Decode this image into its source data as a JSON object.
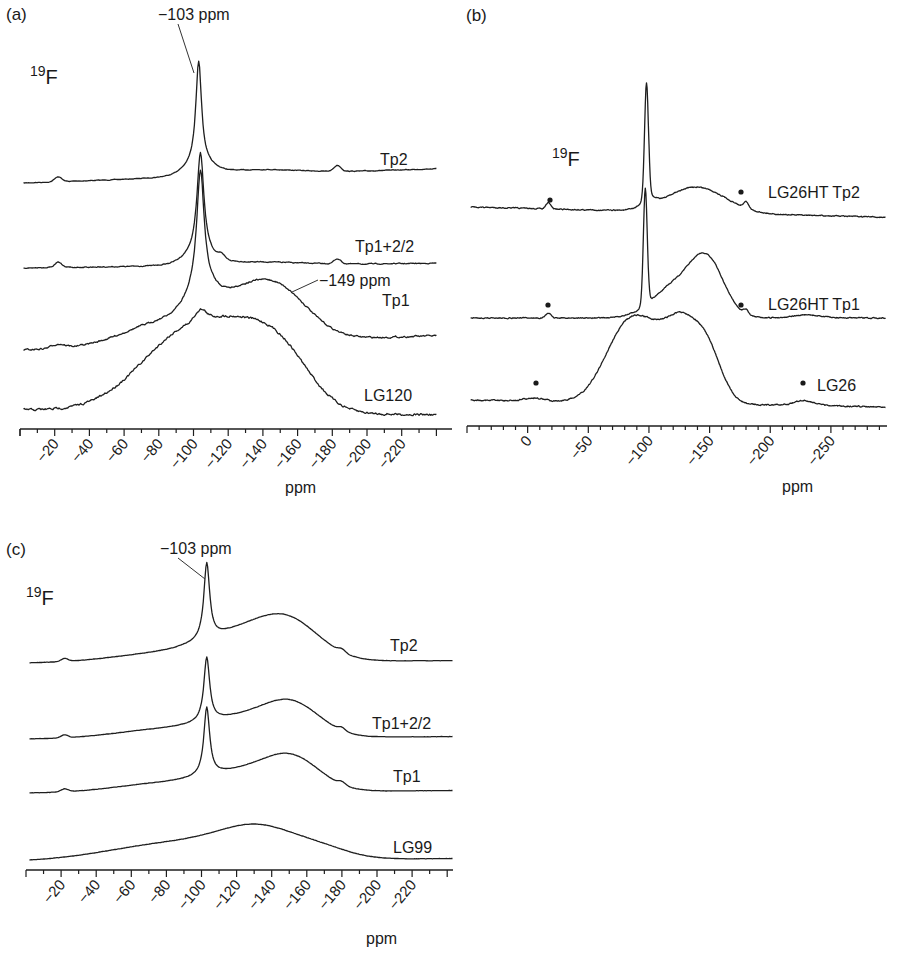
{
  "figure": {
    "panels": [
      {
        "id": "a",
        "label": "(a)",
        "nucleus": {
          "mass": "19",
          "symbol": "F"
        },
        "annotations": [
          {
            "text": "−103 ppm",
            "x": 158,
            "y": 20,
            "line": [
              178,
              24,
              194,
              73
            ]
          },
          {
            "text": "−149 ppm",
            "x": 319,
            "y": 286,
            "line": [
              318,
              280,
              292,
              292
            ]
          }
        ],
        "axis": {
          "label": "ppm",
          "label_x": 285,
          "label_y": 493
        }
      },
      {
        "id": "b",
        "label": "(b)",
        "nucleus": {
          "mass": "19",
          "symbol": "F"
        },
        "annotations": [],
        "axis": {
          "label": "ppm",
          "label_x": 782,
          "label_y": 492
        }
      },
      {
        "id": "c",
        "label": "(c)",
        "nucleus": {
          "mass": "19",
          "symbol": "F"
        },
        "annotations": [
          {
            "text": "−103 ppm",
            "x": 160,
            "y": 554,
            "line": [
              178,
              558,
              205,
              579
            ]
          }
        ],
        "axis": {
          "label": "ppm",
          "label_x": 366,
          "label_y": 944
        }
      }
    ]
  },
  "chart_data": [
    {
      "type": "line",
      "panel": "(a)",
      "title": "",
      "nucleus_label": "19F",
      "xlabel": "ppm",
      "ylabel": "",
      "x_reversed": true,
      "xlim": [
        0,
        -240
      ],
      "x_ticks": [
        -20,
        -40,
        -60,
        -80,
        -100,
        -120,
        -140,
        -160,
        -180,
        -200,
        -220
      ],
      "x_tick_labels": [
        "−20",
        "−40",
        "−60",
        "−80",
        "−100",
        "−120",
        "−140",
        "−160",
        "−180",
        "−200",
        "−220"
      ],
      "grid": false,
      "annotations": [
        "−103 ppm",
        "−149 ppm"
      ],
      "series": [
        {
          "name": "Tp2",
          "peak_ppm": -103,
          "features": "sharp peak at −103 ppm; weak broad hump −110 to −170 ppm; spinning sidebands near −22 and −183 ppm"
        },
        {
          "name": "Tp1+2/2",
          "peak_ppm": -104,
          "features": "sharp peak at −104 ppm; shoulder at −115 ppm; sidebands near −22 and −183 ppm"
        },
        {
          "name": "Tp1",
          "peak_ppm": -104,
          "features": "sharp peak at −104 ppm; broad component centered at −149 ppm"
        },
        {
          "name": "LG120",
          "peak_ppm": -104,
          "features": "broad envelope −50 to −180 ppm with maxima near −104 and −149 ppm"
        }
      ]
    },
    {
      "type": "line",
      "panel": "(b)",
      "title": "",
      "nucleus_label": "19F",
      "xlabel": "ppm",
      "ylabel": "",
      "x_reversed": true,
      "xlim": [
        50,
        -295
      ],
      "x_ticks": [
        0,
        -50,
        -100,
        -150,
        -200,
        -250
      ],
      "x_tick_labels": [
        "0",
        "−50",
        "−100",
        "−150",
        "−200",
        "−250"
      ],
      "grid": false,
      "sideband_marker": "•",
      "series": [
        {
          "name": "LG26HT Tp2",
          "peak_ppm": -98,
          "features": "sharp peak at −98 ppm; broad hump near −145 ppm; sidebands (•) near −17 and −180 ppm"
        },
        {
          "name": "LG26HT Tp1",
          "peak_ppm": -97,
          "features": "sharp peak at −97 ppm; broad peak at −148 ppm; sidebands (•) near −17 and −180 ppm; weak hump near −230 ppm"
        },
        {
          "name": "LG26",
          "peak_ppm": -148,
          "features": "broad plateau −75 to −135 ppm with maximum at −148 ppm; sidebands (•) near −5 and −228 ppm"
        }
      ]
    },
    {
      "type": "line",
      "panel": "(c)",
      "title": "",
      "nucleus_label": "19F",
      "xlabel": "ppm",
      "ylabel": "",
      "x_reversed": true,
      "xlim": [
        0,
        -240
      ],
      "x_ticks": [
        -20,
        -40,
        -60,
        -80,
        -100,
        -120,
        -140,
        -160,
        -180,
        -200,
        -220
      ],
      "x_tick_labels": [
        "−20",
        "−40",
        "−60",
        "−80",
        "−100",
        "−120",
        "−140",
        "−160",
        "−180",
        "−200",
        "−220"
      ],
      "grid": false,
      "annotations": [
        "−103 ppm"
      ],
      "series": [
        {
          "name": "Tp2",
          "peak_ppm": -103,
          "features": "sharp peak at −103 ppm; broad component peaking near −150 ppm"
        },
        {
          "name": "Tp1+2/2",
          "peak_ppm": -103,
          "features": "sharp peak at −103 ppm; broad component peaking near −152 ppm"
        },
        {
          "name": "Tp1",
          "peak_ppm": -103,
          "features": "sharp peak at −103 ppm; broad component peaking near −152 ppm"
        },
        {
          "name": "LG99",
          "peak_ppm": -134,
          "features": "broad single hump centered at −134 ppm, no sharp peak"
        }
      ]
    }
  ],
  "render": {
    "panels": [
      {
        "axis": {
          "x0": 20,
          "x1": 452,
          "y": 429,
          "ppm_at_x0": 0,
          "px_per_ppm": 1.735,
          "minor_every": 10,
          "major_every": 20,
          "tick_labels_from": -20,
          "tick_labels_to": -220
        },
        "traces": [
          {
            "label": "Tp2",
            "label_x": 380,
            "label_y": 165,
            "start_ppm": -2,
            "end_ppm": -240,
            "base_y": 183,
            "slope": -0.06,
            "noise": 0.5,
            "comps": [
              [
                -103,
                104,
                2.0,
                "l"
              ],
              [
                -22,
                5,
                2,
                "g"
              ],
              [
                -183,
                6,
                2,
                "g"
              ],
              [
                -135,
                5,
                25,
                "g"
              ],
              [
                -103,
                10,
                8,
                "g"
              ]
            ]
          },
          {
            "label": "Tp1+2/2",
            "label_x": 355,
            "label_y": 252,
            "start_ppm": -2,
            "end_ppm": -240,
            "base_y": 268,
            "slope": -0.02,
            "noise": 0.7,
            "comps": [
              [
                -104,
                102,
                2.4,
                "l"
              ],
              [
                -22,
                5,
                2,
                "g"
              ],
              [
                -183,
                5,
                2,
                "g"
              ],
              [
                -116,
                4,
                2,
                "g"
              ],
              [
                -135,
                3,
                25,
                "g"
              ],
              [
                -103,
                10,
                8,
                "g"
              ]
            ]
          },
          {
            "label": "Tp1",
            "label_x": 382,
            "label_y": 306,
            "start_ppm": -2,
            "end_ppm": -240,
            "base_y": 350,
            "slope": -0.06,
            "noise": 1.3,
            "comps": [
              [
                -104,
                118,
                2.6,
                "l"
              ],
              [
                -22,
                4,
                4,
                "g"
              ],
              [
                -149,
                46,
                18,
                "g"
              ],
              [
                -120,
                34,
                20,
                "g"
              ],
              [
                -80,
                20,
                22,
                "g"
              ],
              [
                -104,
                18,
                8,
                "g"
              ]
            ]
          },
          {
            "label": "LG120",
            "label_x": 364,
            "label_y": 401,
            "start_ppm": -2,
            "end_ppm": -240,
            "base_y": 410,
            "slope": 0.02,
            "noise": 1.8,
            "comps": [
              [
                -98,
                80,
                28,
                "g"
              ],
              [
                -150,
                55,
                18,
                "g"
              ],
              [
                -125,
                25,
                18,
                "g"
              ],
              [
                -104,
                10,
                3,
                "g"
              ]
            ]
          }
        ],
        "dots": []
      },
      {
        "axis": {
          "x0": 467,
          "x1": 887,
          "y": 426,
          "ppm_at_x0": 50,
          "px_per_ppm": 1.213,
          "minor_every": 10,
          "major_every": 50,
          "tick_labels_from": 0,
          "tick_labels_to": -250
        },
        "traces": [
          {
            "label": "LG26HT Tp2",
            "label_x": 768,
            "label_y": 198,
            "start_ppm": 47,
            "end_ppm": -295,
            "base_y": 207,
            "slope": 0.03,
            "noise": 0.8,
            "comps": [
              [
                -98,
                116,
                1.6,
                "g"
              ],
              [
                -17,
                6,
                2,
                "g"
              ],
              [
                -180,
                7,
                2,
                "g"
              ],
              [
                -145,
                20,
                22,
                "g"
              ],
              [
                -125,
                8,
                20,
                "g"
              ],
              [
                -100,
                8,
                6,
                "g"
              ]
            ]
          },
          {
            "label": "LG26HT Tp1",
            "label_x": 768,
            "label_y": 310,
            "start_ppm": 47,
            "end_ppm": -295,
            "base_y": 318,
            "slope": 0.0,
            "noise": 0.8,
            "comps": [
              [
                -97,
                116,
                1.6,
                "g"
              ],
              [
                -17,
                5,
                2,
                "g"
              ],
              [
                -180,
                5,
                2,
                "g"
              ],
              [
                -148,
                55,
                14,
                "g"
              ],
              [
                -120,
                30,
                18,
                "g"
              ],
              [
                -230,
                3,
                12,
                "g"
              ]
            ]
          },
          {
            "label": "LG26",
            "label_x": 817,
            "label_y": 391,
            "start_ppm": 47,
            "end_ppm": -295,
            "base_y": 400,
            "slope": 0.02,
            "noise": 1.0,
            "comps": [
              [
                -148,
                50,
                12,
                "g"
              ],
              [
                -80,
                63,
                18,
                "g"
              ],
              [
                -110,
                55,
                20,
                "g"
              ],
              [
                -128,
                40,
                12,
                "g"
              ],
              [
                -228,
                5,
                8,
                "g"
              ],
              [
                -5,
                3,
                8,
                "g"
              ]
            ]
          }
        ],
        "dots": [
          [
            550,
            200
          ],
          [
            548,
            305
          ],
          [
            536,
            383
          ],
          [
            741,
            192
          ],
          [
            741,
            305
          ],
          [
            803,
            383
          ]
        ]
      },
      {
        "axis": {
          "x0": 26,
          "x1": 453,
          "y": 870,
          "ppm_at_x0": 0,
          "px_per_ppm": 1.755,
          "minor_every": 10,
          "major_every": 20,
          "tick_labels_from": -20,
          "tick_labels_to": -220
        },
        "traces": [
          {
            "label": "Tp2",
            "label_x": 390,
            "label_y": 651,
            "start_ppm": -2,
            "end_ppm": -243,
            "base_y": 663,
            "slope": -0.01,
            "noise": 0.2,
            "comps": [
              [
                -103,
                76,
                2.0,
                "l"
              ],
              [
                -22,
                3,
                2,
                "g"
              ],
              [
                -180,
                3,
                2,
                "g"
              ],
              [
                -150,
                36,
                18,
                "g"
              ],
              [
                -120,
                24,
                22,
                "g"
              ],
              [
                -75,
                8,
                28,
                "g"
              ]
            ]
          },
          {
            "label": "Tp1+2/2",
            "label_x": 372,
            "label_y": 729,
            "start_ppm": -2,
            "end_ppm": -243,
            "base_y": 739,
            "slope": -0.01,
            "noise": 0.2,
            "comps": [
              [
                -103,
                64,
                2.0,
                "l"
              ],
              [
                -22,
                3,
                2,
                "g"
              ],
              [
                -180,
                3,
                2,
                "g"
              ],
              [
                -152,
                30,
                16,
                "g"
              ],
              [
                -122,
                18,
                22,
                "g"
              ],
              [
                -75,
                8,
                26,
                "g"
              ]
            ]
          },
          {
            "label": "Tp1",
            "label_x": 393,
            "label_y": 782,
            "start_ppm": -2,
            "end_ppm": -243,
            "base_y": 793,
            "slope": -0.01,
            "noise": 0.2,
            "comps": [
              [
                -103,
                68,
                2.0,
                "l"
              ],
              [
                -22,
                3,
                2,
                "g"
              ],
              [
                -180,
                3,
                2,
                "g"
              ],
              [
                -152,
                30,
                16,
                "g"
              ],
              [
                -122,
                18,
                22,
                "g"
              ],
              [
                -75,
                8,
                26,
                "g"
              ]
            ]
          },
          {
            "label": "LG99",
            "label_x": 393,
            "label_y": 853,
            "start_ppm": -2,
            "end_ppm": -243,
            "base_y": 861,
            "slope": -0.01,
            "noise": 0.2,
            "comps": [
              [
                -134,
                28,
                22,
                "g"
              ],
              [
                -95,
                15,
                30,
                "g"
              ],
              [
                -55,
                6,
                28,
                "g"
              ],
              [
                -170,
                8,
                16,
                "g"
              ]
            ]
          }
        ],
        "dots": []
      }
    ],
    "panel_label_pos": [
      [
        6,
        20
      ],
      [
        466,
        21
      ],
      [
        6,
        555
      ]
    ],
    "nucleus_pos": [
      [
        30,
        82
      ],
      [
        524,
        164
      ],
      [
        28,
        603
      ]
    ]
  }
}
